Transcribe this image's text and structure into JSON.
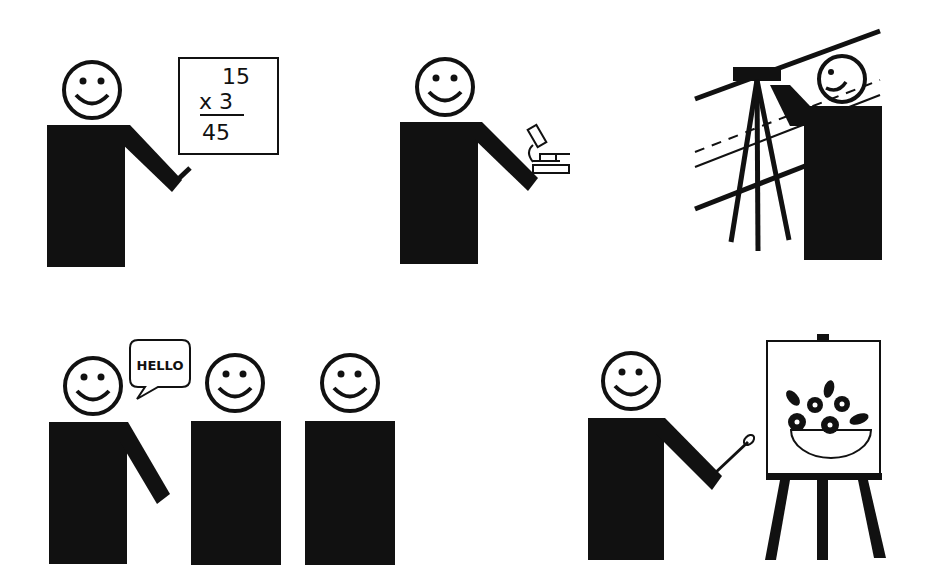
{
  "colors": {
    "ink": "#111111",
    "background": "#ffffff"
  },
  "pictograms": [
    {
      "id": "teacher",
      "label": "Person teaching math at a board",
      "board": {
        "line1": "15",
        "line2": "x 3",
        "line3": "45"
      }
    },
    {
      "id": "scientist",
      "label": "Person with a microscope"
    },
    {
      "id": "surveyor",
      "label": "Person using a surveying tripod instrument"
    },
    {
      "id": "greeter",
      "label": "Person saying hello to two others",
      "speech_bubble": "HELLO"
    },
    {
      "id": "painter",
      "label": "Person painting a flower bowl on an easel"
    }
  ]
}
